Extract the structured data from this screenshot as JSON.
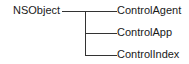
{
  "diagram": {
    "type": "class-hierarchy",
    "root": "NSObject",
    "children": [
      "ControlAgent",
      "ControlApp",
      "ControlIndex"
    ],
    "line_color": "#333333"
  }
}
